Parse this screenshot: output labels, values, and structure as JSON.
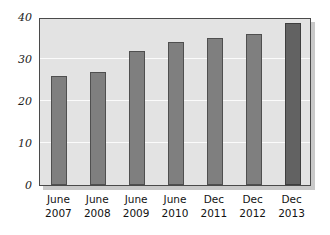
{
  "chart_data": {
    "type": "bar",
    "title": "",
    "subtitle": "",
    "xlabel": "",
    "ylabel": "",
    "categories": [
      "June 2007",
      "June 2008",
      "June 2009",
      "June 2010",
      "Dec 2011",
      "Dec 2012",
      "Dec 2013"
    ],
    "category_lines": [
      {
        "line1": "June",
        "line2": "2007"
      },
      {
        "line1": "June",
        "line2": "2008"
      },
      {
        "line1": "June",
        "line2": "2009"
      },
      {
        "line1": "June",
        "line2": "2010"
      },
      {
        "line1": "Dec",
        "line2": "2011"
      },
      {
        "line1": "Dec",
        "line2": "2012"
      },
      {
        "line1": "Dec",
        "line2": "2013"
      }
    ],
    "values": [
      26,
      27,
      32,
      34,
      35,
      36,
      38.5
    ],
    "ylim": [
      0,
      40
    ],
    "yticks": [
      0,
      10,
      20,
      30,
      40
    ],
    "ytick_labels": [
      "0",
      "10",
      "20",
      "30",
      "40"
    ],
    "grid": true,
    "grid_axis": "y",
    "legend": false,
    "legend_position": "none",
    "bar_color": "#7f7f7f",
    "highlight_bar_index": 6,
    "highlight_bar_color": "#626262",
    "plot_background": "#e3e3e3",
    "gridline_color": "#fbfbfb",
    "axis_color": "#4a4a4a",
    "figure_background": "#ffffff"
  }
}
